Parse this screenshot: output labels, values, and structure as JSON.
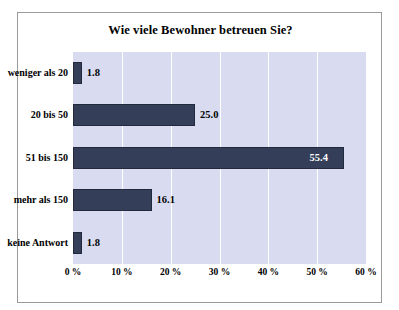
{
  "chart_data": {
    "type": "bar",
    "orientation": "horizontal",
    "title": "Wie viele Bewohner betreuen Sie?",
    "xlabel": "",
    "ylabel": "",
    "categories": [
      "weniger als 20",
      "20 bis 50",
      "51 bis 150",
      "mehr als 150",
      "keine Antwort"
    ],
    "values": [
      1.8,
      25.0,
      55.4,
      16.1,
      1.8
    ],
    "value_labels": [
      "1.8",
      "25.0",
      "55.4",
      "16.1",
      "1.8"
    ],
    "xlim": [
      0,
      60
    ],
    "xticks": [
      0,
      10,
      20,
      30,
      40,
      50,
      60
    ],
    "xticklabels": [
      "0 %",
      "10 %",
      "20 %",
      "30 %",
      "40 %",
      "50 %",
      "60 %"
    ],
    "grid": "vertical",
    "legend": "none",
    "colors": {
      "bar": "#343e58",
      "bar_border": "#232a3d",
      "plot_background": "#d9dcf0",
      "gridline": "#ffffff",
      "frame_border": "#9a9a9a",
      "page_background": "#ffffff",
      "text": "#000000"
    }
  }
}
